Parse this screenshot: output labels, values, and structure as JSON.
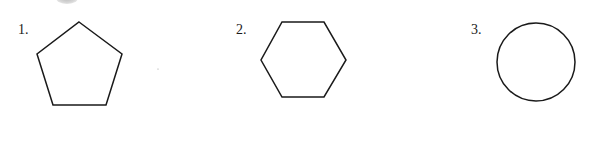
{
  "items": [
    {
      "label": "1.",
      "shape": "pentagon"
    },
    {
      "label": "2.",
      "shape": "hexagon"
    },
    {
      "label": "3.",
      "shape": "circle"
    }
  ],
  "colors": {
    "stroke": "#1a1a1a",
    "background": "#ffffff"
  }
}
